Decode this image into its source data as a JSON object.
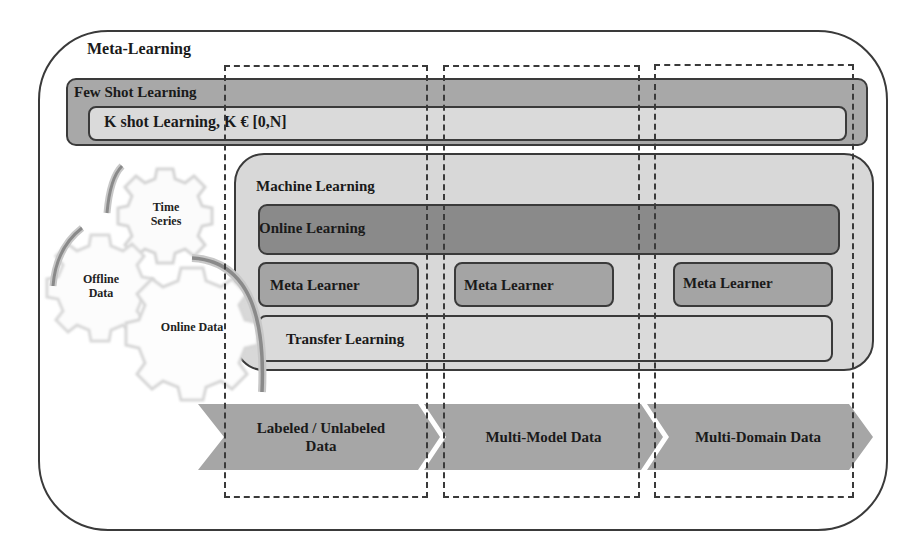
{
  "diagram": {
    "outer": {
      "label": "Meta-Learning"
    },
    "few_shot": {
      "label": "Few Shot Learning",
      "inner_label": "K shot Learning, K € [0,N]"
    },
    "machine_learning": {
      "label": "Machine Learning",
      "online_learning": "Online Learning",
      "meta_learners": [
        "Meta Learner",
        "Meta Learner",
        "Meta Learner"
      ],
      "transfer_learning": "Transfer Learning"
    },
    "gears": [
      {
        "label_line1": "Time",
        "label_line2": "Series"
      },
      {
        "label_line1": "Offline",
        "label_line2": "Data"
      },
      {
        "label_line1": "Online Data",
        "label_line2": ""
      }
    ],
    "chevrons": [
      {
        "label_line1": "Labeled / Unlabeled",
        "label_line2": "Data"
      },
      {
        "label_line1": "Multi-Model Data",
        "label_line2": ""
      },
      {
        "label_line1": "Multi-Domain Data",
        "label_line2": ""
      }
    ],
    "colors": {
      "few_shot_fill": "#a8a8a8",
      "k_shot_fill": "#dadada",
      "ml_fill": "#d8d8d8",
      "online_fill": "#8a8a8a",
      "meta_fill": "#a4a4a4",
      "chevron_fill": "#a6a6a6",
      "stroke": "#3a3a3a"
    }
  }
}
